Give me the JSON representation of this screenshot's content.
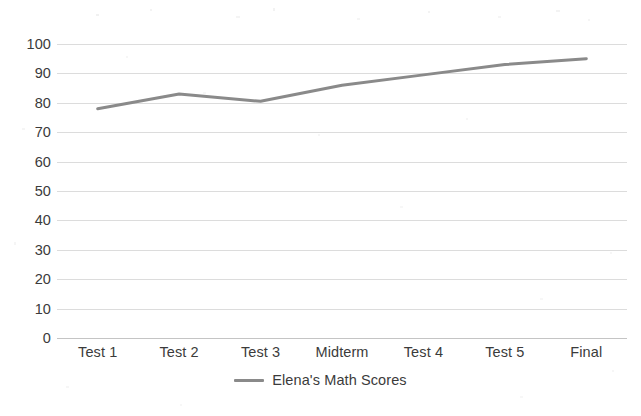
{
  "chart_data": {
    "type": "line",
    "title": "",
    "subtitle": "",
    "xlabel": "",
    "ylabel": "",
    "categories": [
      "Test 1",
      "Test 2",
      "Test 3",
      "Midterm",
      "Test 4",
      "Test 5",
      "Final"
    ],
    "series": [
      {
        "name": "Elena's Math Scores",
        "values": [
          78,
          83,
          80.5,
          86,
          89.5,
          93,
          95
        ],
        "color": "#8a8a8a"
      }
    ],
    "ylim": [
      0,
      100
    ],
    "y_ticks": [
      0,
      10,
      20,
      30,
      40,
      50,
      60,
      70,
      80,
      90,
      100
    ],
    "y_tick_labels": [
      "0",
      "10",
      "20",
      "30",
      "40",
      "50",
      "60",
      "70",
      "80",
      "90",
      "100"
    ],
    "grid": "horizontal",
    "legend_position": "bottom-center",
    "markers": false,
    "line_width": 3
  },
  "legend": {
    "items": [
      {
        "label": "Elena's Math Scores",
        "swatch_name": "legend-swatch-elena-math-scores"
      }
    ]
  },
  "colors": {
    "series_line": "#8a8a8a",
    "gridline": "#dcdcdc",
    "axis_line": "#c4c4c4",
    "text": "#3b3b3b",
    "background": "#ffffff"
  }
}
